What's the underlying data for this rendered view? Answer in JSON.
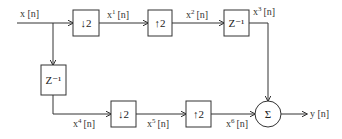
{
  "diagram": {
    "type": "signal-flow block diagram",
    "colors": {
      "line": "#333333",
      "background": "#ffffff"
    },
    "input": {
      "label": "x [n]"
    },
    "output": {
      "label": "y [n]"
    },
    "blocks": [
      {
        "id": "down1",
        "label": "↓2",
        "kind": "downsampler"
      },
      {
        "id": "up1",
        "label": "↑2",
        "kind": "upsampler"
      },
      {
        "id": "delay1",
        "label": "Z⁻¹",
        "kind": "delay"
      },
      {
        "id": "delay2",
        "label": "Z⁻¹",
        "kind": "delay"
      },
      {
        "id": "down2",
        "label": "↓2",
        "kind": "downsampler"
      },
      {
        "id": "up2",
        "label": "↑2",
        "kind": "upsampler"
      },
      {
        "id": "sum",
        "label": "Σ",
        "kind": "adder"
      }
    ],
    "signals": [
      {
        "id": "x1",
        "base": "x",
        "sup": "1",
        "arg": "[n]"
      },
      {
        "id": "x2",
        "base": "x",
        "sup": "2",
        "arg": "[n]"
      },
      {
        "id": "x3",
        "base": "x",
        "sup": "3",
        "arg": "[n]"
      },
      {
        "id": "x4",
        "base": "x",
        "sup": "4",
        "arg": "[n]"
      },
      {
        "id": "x5",
        "base": "x",
        "sup": "5",
        "arg": "[n]"
      },
      {
        "id": "x6",
        "base": "x",
        "sup": "6",
        "arg": "[n]"
      }
    ]
  }
}
